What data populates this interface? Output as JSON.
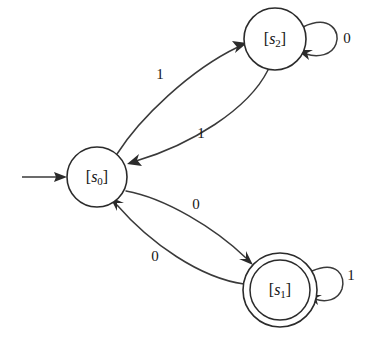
{
  "diagram": {
    "kind": "finite-state-machine",
    "title": "",
    "background_color": "#ffffff",
    "line_color": "#3a3a3a",
    "text_color": "#141414",
    "states": [
      {
        "id": "s0",
        "label_prefix": "[",
        "label_var": "s",
        "label_sub": "0",
        "label_suffix": "]",
        "label_text": "[s0]",
        "cx": 97,
        "cy": 177,
        "r": 30,
        "accepting": false,
        "start": true
      },
      {
        "id": "s2",
        "label_prefix": "[",
        "label_var": "s",
        "label_sub": "2",
        "label_suffix": "]",
        "label_text": "[s2]",
        "cx": 275,
        "cy": 39,
        "r": 31,
        "accepting": false,
        "start": false
      },
      {
        "id": "s1",
        "label_prefix": "[",
        "label_var": "s",
        "label_sub": "1",
        "label_suffix": "]",
        "label_text": "[s1]",
        "cx": 280,
        "cy": 290,
        "r": 37,
        "r_inner": 30,
        "accepting": true,
        "start": false
      }
    ],
    "start_marker": {
      "from_x": 22,
      "to_x": 67,
      "y": 177
    },
    "transitions": [
      {
        "id": "s0-to-s2",
        "from": "s0",
        "to": "s2",
        "symbol": "1",
        "label_x": 160,
        "label_y": 76
      },
      {
        "id": "s2-to-s0",
        "from": "s2",
        "to": "s0",
        "symbol": "1",
        "label_x": 201,
        "label_y": 135
      },
      {
        "id": "s0-to-s1",
        "from": "s0",
        "to": "s1",
        "symbol": "0",
        "label_x": 196,
        "label_y": 206
      },
      {
        "id": "s1-to-s0",
        "from": "s1",
        "to": "s0",
        "symbol": "0",
        "label_x": 155,
        "label_y": 258
      },
      {
        "id": "s2-self-loop",
        "from": "s2",
        "to": "s2",
        "symbol": "0",
        "self_loop": true,
        "label_x": 347,
        "label_y": 40
      },
      {
        "id": "s1-self-loop",
        "from": "s1",
        "to": "s1",
        "symbol": "1",
        "self_loop": true,
        "label_x": 351,
        "label_y": 277
      }
    ]
  }
}
